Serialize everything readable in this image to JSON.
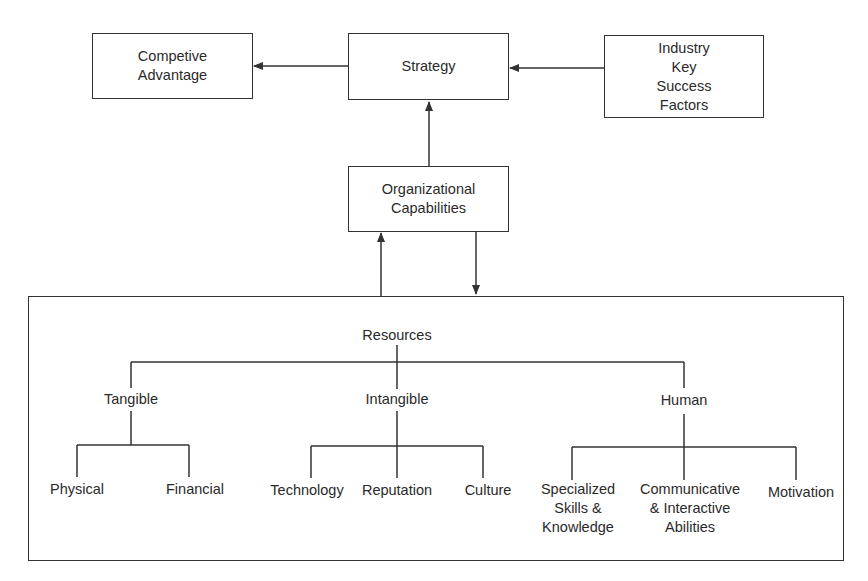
{
  "boxes": {
    "competitive_advantage": "Competive\nAdvantage",
    "strategy": "Strategy",
    "industry_ksf": "Industry\nKey\nSuccess\nFactors",
    "org_capabilities": "Organizational\nCapabilities"
  },
  "resources": {
    "root": "Resources",
    "tangible": {
      "label": "Tangible",
      "children": [
        "Physical",
        "Financial"
      ]
    },
    "intangible": {
      "label": "Intangible",
      "children": [
        "Technology",
        "Reputation",
        "Culture"
      ]
    },
    "human": {
      "label": "Human",
      "children": [
        "Specialized\nSkills &\nKnowledge",
        "Communicative\n& Interactive\nAbilities",
        "Motivation"
      ]
    }
  },
  "colors": {
    "line": "#333333",
    "text": "#2a2a2a"
  }
}
